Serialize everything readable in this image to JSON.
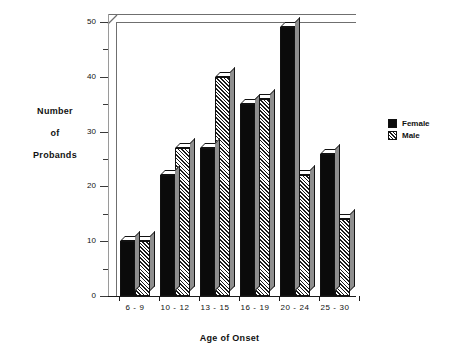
{
  "chart_data": {
    "type": "bar",
    "title": "",
    "xlabel": "Age of Onset",
    "ylabel": "Number of Probands",
    "ylabel_lines": [
      "Number",
      "of",
      "Probands"
    ],
    "categories": [
      "6 - 9",
      "10 - 12",
      "13 - 15",
      "16 - 19",
      "20 - 24",
      "25 - 30"
    ],
    "series": [
      {
        "name": "Female",
        "values": [
          10,
          22,
          27,
          35,
          49,
          26
        ],
        "color": "#0b0b0b",
        "fill": "solid"
      },
      {
        "name": "Male",
        "values": [
          10,
          27,
          40,
          36,
          22,
          14
        ],
        "color": "#1b1b1b",
        "fill": "diagonal-hatch"
      }
    ],
    "ylim": [
      0,
      50
    ],
    "yticks_major": [
      0,
      10,
      20,
      30,
      40,
      50
    ],
    "yticks_minor": [
      5,
      15,
      25,
      35,
      45
    ],
    "grid": false,
    "legend_position": "right",
    "style": "3d-bars"
  },
  "legend": {
    "items": [
      {
        "label": "Female"
      },
      {
        "label": "Male"
      }
    ]
  }
}
